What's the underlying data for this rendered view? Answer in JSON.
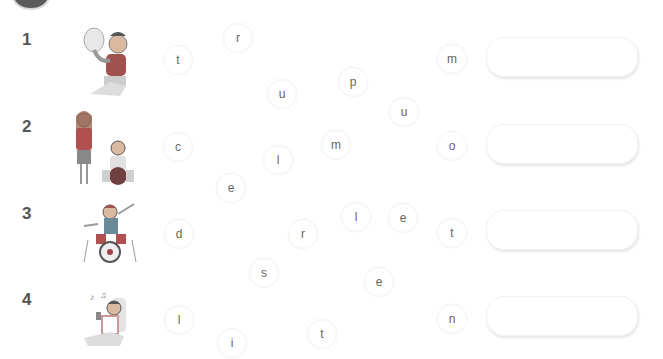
{
  "worksheet": {
    "items": [
      {
        "number": "1",
        "illustration": "boy-playing-tuba",
        "letters": [
          {
            "char": "t",
            "x": 177,
            "y": 59
          },
          {
            "char": "r",
            "x": 237,
            "y": 37
          },
          {
            "char": "u",
            "x": 281,
            "y": 93
          },
          {
            "char": "p",
            "x": 352,
            "y": 81
          },
          {
            "char": "u",
            "x": 403,
            "y": 111
          },
          {
            "char": "m",
            "x": 451,
            "y": 58
          }
        ],
        "answer_value": ""
      },
      {
        "number": "2",
        "illustration": "girl-singing-boy-playing-cello",
        "letters": [
          {
            "char": "c",
            "x": 177,
            "y": 146
          },
          {
            "char": "l",
            "x": 277,
            "y": 159
          },
          {
            "char": "e",
            "x": 230,
            "y": 187
          },
          {
            "char": "m",
            "x": 335,
            "y": 144
          },
          {
            "char": "o",
            "x": 451,
            "y": 145
          }
        ],
        "answer_value": ""
      },
      {
        "number": "3",
        "illustration": "boy-playing-drums",
        "letters": [
          {
            "char": "d",
            "x": 178,
            "y": 233
          },
          {
            "char": "r",
            "x": 302,
            "y": 233
          },
          {
            "char": "l",
            "x": 355,
            "y": 216
          },
          {
            "char": "e",
            "x": 402,
            "y": 217
          },
          {
            "char": "t",
            "x": 451,
            "y": 232
          },
          {
            "char": "s",
            "x": 263,
            "y": 272
          },
          {
            "char": "e",
            "x": 378,
            "y": 281
          }
        ],
        "answer_value": ""
      },
      {
        "number": "4",
        "illustration": "boy-listening-to-music",
        "letters": [
          {
            "char": "l",
            "x": 178,
            "y": 319
          },
          {
            "char": "i",
            "x": 231,
            "y": 342
          },
          {
            "char": "t",
            "x": 321,
            "y": 333
          },
          {
            "char": "n",
            "x": 451,
            "y": 318
          }
        ],
        "answer_value": ""
      }
    ]
  }
}
